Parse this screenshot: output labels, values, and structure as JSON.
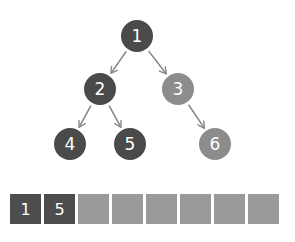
{
  "colors": {
    "dark_node": "#4a4a4a",
    "light_node": "#8c8c8c",
    "arrow": "#8a8a8a",
    "filled_cell": "#4d4d4d",
    "empty_cell": "#9a9a9a"
  },
  "tree": {
    "nodes": [
      {
        "id": "1",
        "label": "1",
        "x": 137,
        "y": 36,
        "shade": "dark"
      },
      {
        "id": "2",
        "label": "2",
        "x": 100,
        "y": 89,
        "shade": "dark"
      },
      {
        "id": "3",
        "label": "3",
        "x": 178,
        "y": 89,
        "shade": "light"
      },
      {
        "id": "4",
        "label": "4",
        "x": 70,
        "y": 144,
        "shade": "dark"
      },
      {
        "id": "5",
        "label": "5",
        "x": 130,
        "y": 144,
        "shade": "dark"
      },
      {
        "id": "6",
        "label": "6",
        "x": 215,
        "y": 144,
        "shade": "light"
      }
    ],
    "edges": [
      {
        "from": "1",
        "to": "2"
      },
      {
        "from": "1",
        "to": "3"
      },
      {
        "from": "2",
        "to": "4"
      },
      {
        "from": "2",
        "to": "5"
      },
      {
        "from": "3",
        "to": "6"
      }
    ]
  },
  "array": {
    "cells": [
      {
        "label": "1",
        "filled": true
      },
      {
        "label": "5",
        "filled": true
      },
      {
        "label": "",
        "filled": false
      },
      {
        "label": "",
        "filled": false
      },
      {
        "label": "",
        "filled": false
      },
      {
        "label": "",
        "filled": false
      },
      {
        "label": "",
        "filled": false
      },
      {
        "label": "",
        "filled": false
      }
    ]
  }
}
